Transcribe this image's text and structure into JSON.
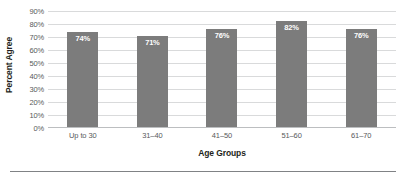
{
  "chart_data": {
    "type": "bar",
    "title": "",
    "xlabel": "Age Groups",
    "ylabel": "Percent Agree",
    "categories": [
      "Up to 30",
      "31–40",
      "41–50",
      "51–60",
      "61–70"
    ],
    "values": [
      74,
      71,
      76,
      82,
      76
    ],
    "value_labels": [
      "74%",
      "71%",
      "76%",
      "82%",
      "76%"
    ],
    "ylim": [
      0,
      90
    ],
    "ytick_values": [
      0,
      10,
      20,
      30,
      40,
      50,
      60,
      70,
      80,
      90
    ],
    "ytick_labels": [
      "0%",
      "10%",
      "20%",
      "30%",
      "40%",
      "50%",
      "60%",
      "70%",
      "80%",
      "90%"
    ],
    "grid": "horizontal",
    "legend": "none",
    "colors": {
      "bar": "#7c7c7c",
      "gridline": "#d9dadb",
      "axis_line": "#bcbec0",
      "tick_text": "#58595b",
      "title_text": "#231f20",
      "bar_label_text": "#ffffff",
      "background": "#ffffff",
      "bottom_rule": "#808285"
    }
  }
}
